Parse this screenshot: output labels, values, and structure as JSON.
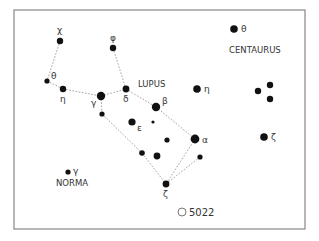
{
  "map": {
    "border_color": "#888888",
    "line_color": "#999999",
    "star_color": "#111111",
    "constellation_labels": [
      {
        "id": "lupus",
        "text": "LUPUS",
        "x": 138,
        "y": 87
      },
      {
        "id": "centaurus",
        "text": "CENTAURUS",
        "x": 229,
        "y": 53
      },
      {
        "id": "norma",
        "text": "NORMA",
        "x": 56,
        "y": 186
      }
    ],
    "stars": [
      {
        "id": "lup-chi",
        "greek": "χ",
        "x": 60,
        "y": 41,
        "r": 3.2,
        "lx": 57,
        "ly": 33
      },
      {
        "id": "lup-theta",
        "greek": "θ",
        "x": 47,
        "y": 81,
        "r": 2.6,
        "lx": 51,
        "ly": 79
      },
      {
        "id": "lup-eta",
        "greek": "η",
        "x": 63,
        "y": 89,
        "r": 3.2,
        "lx": 60,
        "ly": 102
      },
      {
        "id": "lup-gamma",
        "greek": "γ",
        "x": 101,
        "y": 96,
        "r": 4.2,
        "lx": 91,
        "ly": 106
      },
      {
        "id": "lup-phi",
        "greek": "φ",
        "x": 113,
        "y": 48,
        "r": 3.2,
        "lx": 110,
        "ly": 41
      },
      {
        "id": "lup-delta",
        "greek": "δ",
        "x": 126,
        "y": 89,
        "r": 3.4,
        "lx": 123,
        "ly": 102
      },
      {
        "id": "lup-beta",
        "greek": "β",
        "x": 156,
        "y": 107,
        "r": 4.2,
        "lx": 162,
        "ly": 104
      },
      {
        "id": "lup-epsilon",
        "greek": "ε",
        "x": 132,
        "y": 122,
        "r": 3.6,
        "lx": 137,
        "ly": 131
      },
      {
        "id": "lup-alpha",
        "greek": "α",
        "x": 195,
        "y": 139,
        "r": 4.4,
        "lx": 202,
        "ly": 143
      },
      {
        "id": "lup-zeta",
        "greek": "ζ",
        "x": 166,
        "y": 184,
        "r": 3.4,
        "lx": 163,
        "ly": 197
      },
      {
        "id": "lup-a",
        "greek": "",
        "x": 102,
        "y": 114,
        "r": 2.6
      },
      {
        "id": "lup-b",
        "greek": "",
        "x": 153,
        "y": 122,
        "r": 1.6
      },
      {
        "id": "lup-c",
        "greek": "",
        "x": 167,
        "y": 140,
        "r": 2.6
      },
      {
        "id": "lup-d",
        "greek": "",
        "x": 142,
        "y": 153,
        "r": 2.8
      },
      {
        "id": "lup-e",
        "greek": "",
        "x": 157,
        "y": 156,
        "r": 3.4
      },
      {
        "id": "lup-f",
        "greek": "",
        "x": 200,
        "y": 157,
        "r": 2.6
      },
      {
        "id": "cen-theta",
        "greek": "θ",
        "x": 234,
        "y": 29,
        "r": 3.8,
        "lx": 241,
        "ly": 32
      },
      {
        "id": "cen-eta",
        "greek": "η",
        "x": 197,
        "y": 89,
        "r": 3.8,
        "lx": 204,
        "ly": 92
      },
      {
        "id": "cen-a",
        "greek": "",
        "x": 258,
        "y": 91,
        "r": 3.2
      },
      {
        "id": "cen-b",
        "greek": "",
        "x": 270,
        "y": 85,
        "r": 3.2
      },
      {
        "id": "cen-c",
        "greek": "",
        "x": 270,
        "y": 99,
        "r": 3.2
      },
      {
        "id": "cen-zeta",
        "greek": "ζ",
        "x": 264,
        "y": 137,
        "r": 3.8,
        "lx": 271,
        "ly": 140
      },
      {
        "id": "nor-gamma",
        "greek": "γ",
        "x": 68,
        "y": 172,
        "r": 2.6,
        "lx": 73,
        "ly": 174
      }
    ],
    "lines": [
      [
        "lup-chi",
        "lup-theta"
      ],
      [
        "lup-theta",
        "lup-eta"
      ],
      [
        "lup-eta",
        "lup-gamma"
      ],
      [
        "lup-gamma",
        "lup-delta"
      ],
      [
        "lup-phi",
        "lup-delta"
      ],
      [
        "lup-delta",
        "lup-beta"
      ],
      [
        "lup-beta",
        "lup-alpha"
      ],
      [
        "lup-gamma",
        "lup-a"
      ],
      [
        "lup-a",
        "lup-d"
      ],
      [
        "lup-d",
        "lup-zeta"
      ],
      [
        "lup-alpha",
        "lup-zeta"
      ],
      [
        "lup-f",
        "lup-zeta"
      ]
    ],
    "deep_sky": [
      {
        "id": "ngc5022",
        "label": "5022",
        "x": 182,
        "y": 212,
        "r": 4
      }
    ]
  }
}
